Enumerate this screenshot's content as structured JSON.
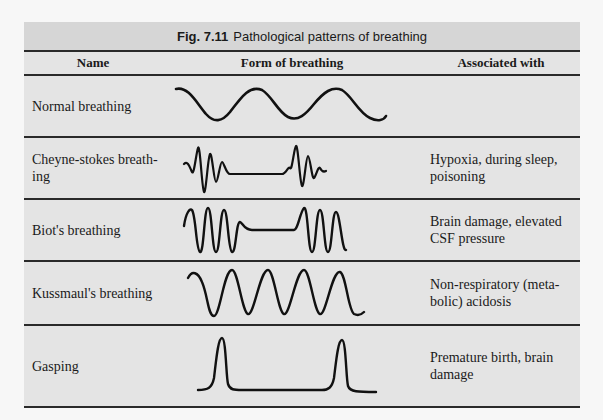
{
  "figure": {
    "number": "Fig. 7.11",
    "title": "Pathological patterns of breathing",
    "accent_colors": {
      "title_bar": "#d6d6d6",
      "table_body": "#e4e4e4",
      "rule": "#2a2a2a",
      "trace": "#111111"
    }
  },
  "table": {
    "columns": [
      "Name",
      "Form of breathing",
      "Associated with"
    ],
    "rows": [
      {
        "name": "Normal breathing",
        "form_icon": "regular-sine-wave",
        "associated": ""
      },
      {
        "name": "Cheyne-stokes breath-ing",
        "form_icon": "crescendo-decrescendo-with-apnea-wave",
        "associated": "Hypoxia, during sleep, poisoning"
      },
      {
        "name": "Biot's breathing",
        "form_icon": "deep-burst-with-apnea-wave",
        "associated": "Brain damage, elevated CSF pressure"
      },
      {
        "name": "Kussmaul's breathing",
        "form_icon": "deep-rapid-wave",
        "associated": "Non-respiratory (meta-bolic) acidosis"
      },
      {
        "name": "Gasping",
        "form_icon": "isolated-spike-wave",
        "associated": "Premature birth, brain damage"
      }
    ]
  }
}
